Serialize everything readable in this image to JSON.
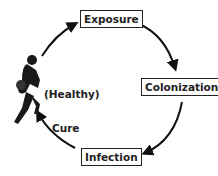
{
  "diagram": {
    "nodes": [
      {
        "id": "exposure",
        "label": "Exposure"
      },
      {
        "id": "colonization",
        "label": "Colonization"
      },
      {
        "id": "infection",
        "label": "Infection"
      },
      {
        "id": "healthy",
        "label": "(Healthy)"
      }
    ],
    "edges": [
      {
        "from": "healthy",
        "to": "exposure",
        "label": ""
      },
      {
        "from": "exposure",
        "to": "colonization",
        "label": ""
      },
      {
        "from": "colonization",
        "to": "infection",
        "label": ""
      },
      {
        "from": "infection",
        "to": "healthy",
        "label": "Cure"
      }
    ],
    "figure": "basketball-player-silhouette"
  }
}
